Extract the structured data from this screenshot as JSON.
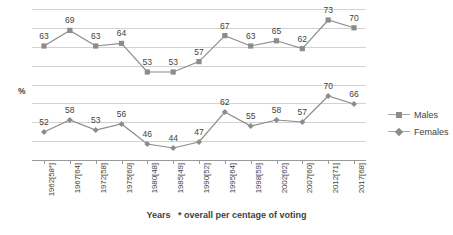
{
  "chart_data": {
    "type": "line",
    "title": "",
    "subtitle": "",
    "xlabel": "Years   * overall per centage of voting",
    "ylabel": "%",
    "grid": true,
    "legend_position": "right",
    "categories": [
      "1962[58*]",
      "1967[64]",
      "1972[58]",
      "1975[60]",
      "1980[48]",
      "1985[49]",
      "1990[52]",
      "1995[64]",
      "1998[59]",
      "2002[62]",
      "2007[60]",
      "2012[71]",
      "2017[68]"
    ],
    "series": [
      {
        "name": "Males",
        "marker": "square",
        "color": "#8c8c8c",
        "values": [
          63,
          69,
          63,
          64,
          53,
          53,
          57,
          67,
          63,
          65,
          62,
          73,
          70
        ]
      },
      {
        "name": "Females",
        "marker": "diamond",
        "color": "#8c8c8c",
        "values": [
          52,
          58,
          53,
          56,
          46,
          44,
          47,
          62,
          55,
          58,
          57,
          70,
          66
        ]
      }
    ],
    "ylim": [
      40,
      76
    ],
    "gridline_count": 9
  },
  "axis": {
    "y_caption": "%",
    "x_caption_main": "Years",
    "x_caption_note": "* overall per centage of voting"
  },
  "legend": {
    "items": [
      {
        "label": "Males",
        "marker": "square-marker-icon"
      },
      {
        "label": "Females",
        "marker": "diamond-marker-icon"
      }
    ]
  }
}
